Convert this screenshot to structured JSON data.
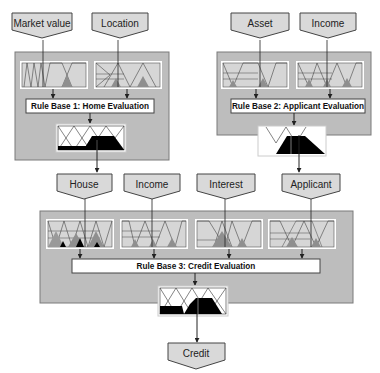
{
  "diagram": {
    "colors": {
      "panel": "#bdbdbd",
      "panel_border": "#7a7a7a",
      "node_fill": "#d9d9d9",
      "node_border": "#444444",
      "mf_fill": "#d6d6d6",
      "mf_dark": "#8f8f8f",
      "output_fill": "#000000",
      "background": "#ffffff"
    },
    "inputs": {
      "market_value": "Market value",
      "location": "Location",
      "asset": "Asset",
      "income_top": "Income"
    },
    "rule_bases": {
      "rb1": "Rule Base 1: Home Evaluation",
      "rb2": "Rule Base 2: Applicant Evaluation",
      "rb3": "Rule Base 3: Credit Evaluation"
    },
    "intermediate": {
      "house": "House",
      "income": "Income",
      "interest": "Interest",
      "applicant": "Applicant"
    },
    "output": {
      "credit": "Credit"
    }
  }
}
